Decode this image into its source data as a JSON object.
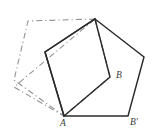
{
  "figure": {
    "width": 155,
    "height": 137,
    "background_color": "#ffffff",
    "solid_color": "#2b2b2b",
    "dashed_color": "#8f8f93"
  },
  "labels": [
    {
      "id": "label-b",
      "text": "B",
      "x": 116,
      "y": 71
    },
    {
      "id": "label-a",
      "text": "A",
      "x": 60,
      "y": 119
    },
    {
      "id": "label-b-prime",
      "text": "B'",
      "x": 130,
      "y": 118
    }
  ],
  "shapes": {
    "solid_pentagon": {
      "name": "solid-pentagon",
      "style": "solid",
      "points": "95,19 144,57 128,116 64,116 45,52"
    },
    "solid_quadrilateral": {
      "name": "solid-square",
      "style": "solid",
      "points": "95,19 110,77 64,116 45,52"
    },
    "dashed_pentagon": {
      "name": "dashed-pentagon",
      "style": "dashed",
      "points": "95,19 28,21 14,80 64,116 110,77"
    },
    "dashed_quadrilateral": {
      "name": "dashed-square",
      "style": "dashed",
      "points": "95,19 110,77 64,116 14,87"
    }
  }
}
